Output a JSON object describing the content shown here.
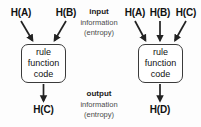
{
  "diagram": {
    "background_color": "#fdfdfd",
    "line_color": "#222222",
    "box_border_color": "#3b3b3b",
    "center_captions": {
      "input": {
        "line1": "input",
        "line2": "information",
        "line3": "(entropy)"
      },
      "output": {
        "line1": "output",
        "line2": "information",
        "line3": "(entropy)"
      }
    },
    "left_diagram": {
      "name": "two-input-rule",
      "inputs": [
        {
          "label": "H(A)"
        },
        {
          "label": "H(B)"
        }
      ],
      "process_box": {
        "line1": "rule",
        "line2": "function",
        "line3": "code"
      },
      "outputs": [
        {
          "label": "H(C)"
        }
      ]
    },
    "right_diagram": {
      "name": "three-input-rule",
      "inputs": [
        {
          "label": "H(A)"
        },
        {
          "label": "H(B)"
        },
        {
          "label": "H(C)"
        }
      ],
      "process_box": {
        "line1": "rule",
        "line2": "function",
        "line3": "code"
      },
      "outputs": [
        {
          "label": "H(D)"
        }
      ]
    }
  }
}
